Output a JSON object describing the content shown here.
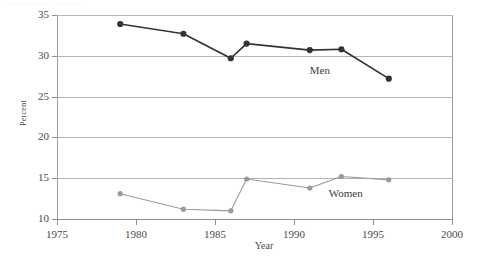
{
  "caption": "...............  ...............  ...  ... ... ....  .....",
  "chart_data": {
    "type": "line",
    "title": "",
    "xlabel": "Year",
    "ylabel": "Percent",
    "xlim": [
      1975,
      2000
    ],
    "ylim": [
      10,
      35
    ],
    "xticks": [
      1975,
      1980,
      1985,
      1990,
      1995,
      2000
    ],
    "yticks": [
      10,
      15,
      20,
      25,
      30,
      35
    ],
    "grid": true,
    "legend_position": "inline-annotation",
    "series": [
      {
        "name": "Men",
        "color": "#333333",
        "marker": "circle",
        "x": [
          1979,
          1983,
          1986,
          1987,
          1991,
          1993,
          1996
        ],
        "values": [
          33.9,
          32.7,
          29.7,
          31.5,
          30.7,
          30.8,
          27.2
        ],
        "label": "Men",
        "label_x": 1991.0,
        "label_y": 28.2
      },
      {
        "name": "Women",
        "color": "#9a9a9a",
        "marker": "circle",
        "x": [
          1979,
          1983,
          1986,
          1987,
          1991,
          1993,
          1996
        ],
        "values": [
          13.1,
          11.2,
          11.0,
          14.9,
          13.8,
          15.2,
          14.8
        ],
        "label": "Women",
        "label_x": 1992.2,
        "label_y": 13.2
      }
    ]
  }
}
